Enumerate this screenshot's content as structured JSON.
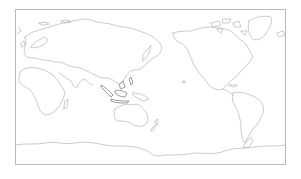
{
  "map": {
    "projection": "pacific-centered equirectangular",
    "frame_color": "#b9b9b9",
    "coastline_color": "#a8a8a8",
    "background": "#ffffff",
    "regions": [
      "Europe",
      "Africa",
      "Asia",
      "Indonesia",
      "Australia",
      "New Zealand",
      "North America",
      "Greenland",
      "South America",
      "Antarctica"
    ]
  }
}
